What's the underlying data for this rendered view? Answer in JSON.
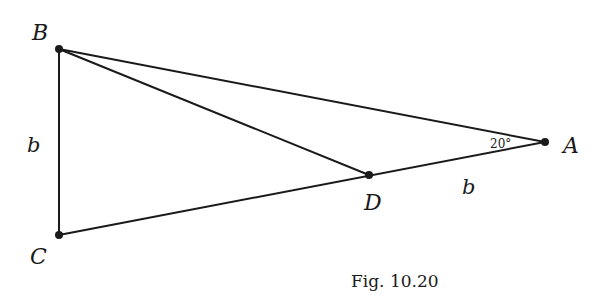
{
  "figure": {
    "caption": "Fig. 10.20",
    "points": {
      "A": {
        "label": "A",
        "x": 545,
        "y": 142
      },
      "B": {
        "label": "B",
        "x": 59,
        "y": 49
      },
      "C": {
        "label": "C",
        "x": 59,
        "y": 235
      },
      "D": {
        "label": "D",
        "x": 369,
        "y": 175
      }
    },
    "segments": [
      "BA",
      "BD",
      "BC",
      "CA"
    ],
    "labels": {
      "side_bc": "b",
      "side_da": "b",
      "angle_a": "20°"
    },
    "colors": {
      "line": "#1a1a1a",
      "background": "#ffffff"
    }
  }
}
